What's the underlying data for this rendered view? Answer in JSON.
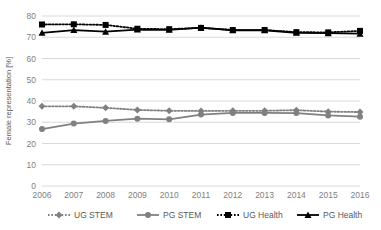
{
  "chart_data": {
    "type": "line",
    "title": "",
    "xlabel": "",
    "ylabel": "Female representation [%]",
    "categories": [
      "2006",
      "2007",
      "2008",
      "2009",
      "2010",
      "2011",
      "2012",
      "2013",
      "2014",
      "2015",
      "2016"
    ],
    "x": [
      2006,
      2007,
      2008,
      2009,
      2010,
      2011,
      2012,
      2013,
      2014,
      2015,
      2016
    ],
    "ylim": [
      0,
      80
    ],
    "yticks": [
      0,
      10,
      20,
      30,
      40,
      50,
      60,
      70,
      80
    ],
    "ytick_labels": [
      "0",
      "10",
      "20",
      "30",
      "40",
      "50",
      "60",
      "70",
      "80"
    ],
    "grid": true,
    "legend_position": "bottom",
    "series": [
      {
        "name": "UG STEM",
        "values": [
          37.5,
          37.5,
          36.8,
          35.8,
          35.4,
          35.3,
          35.4,
          35.4,
          35.7,
          35.0,
          34.8
        ],
        "color": "#808080",
        "line_style": "dotted",
        "marker": "diamond"
      },
      {
        "name": "PG STEM",
        "values": [
          26.8,
          29.4,
          30.6,
          31.7,
          31.4,
          33.6,
          34.4,
          34.4,
          34.3,
          33.2,
          32.6
        ],
        "color": "#808080",
        "line_style": "solid",
        "marker": "circle"
      },
      {
        "name": "UG Health",
        "values": [
          76.0,
          76.1,
          75.8,
          74.0,
          73.8,
          74.4,
          73.4,
          73.4,
          72.4,
          72.3,
          73.0
        ],
        "color": "#000000",
        "line_style": "dotted",
        "marker": "square"
      },
      {
        "name": "PG Health",
        "values": [
          72.1,
          73.4,
          72.6,
          73.6,
          73.5,
          74.5,
          73.3,
          73.3,
          72.1,
          71.9,
          71.7
        ],
        "color": "#000000",
        "line_style": "solid",
        "marker": "triangle"
      }
    ]
  },
  "colors": {
    "grid": "#d9d9d9",
    "axis": "#d9d9d9",
    "tick_text": "#7f7f7f",
    "label_text": "#595959",
    "stem": "#808080",
    "health": "#000000",
    "background": "#ffffff"
  },
  "legend": {
    "items": [
      {
        "label": "UG STEM"
      },
      {
        "label": "PG STEM"
      },
      {
        "label": "UG Health"
      },
      {
        "label": "PG Health"
      }
    ]
  }
}
